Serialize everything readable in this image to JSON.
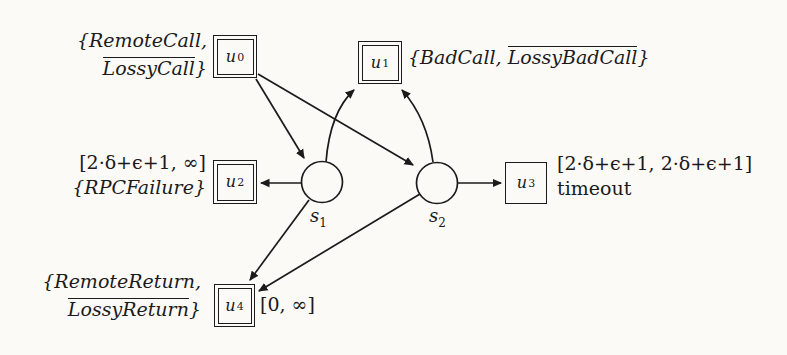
{
  "colors": {
    "ink": "#1b1b1b",
    "paper": "#fbfaf7"
  },
  "nodes": {
    "u0": {
      "base": "u",
      "sup": "0"
    },
    "u1": {
      "base": "u",
      "sup": "1"
    },
    "u2": {
      "base": "u",
      "sup": "2"
    },
    "u3": {
      "base": "u",
      "sup": "3"
    },
    "u4": {
      "base": "u",
      "sup": "4"
    },
    "s1": {
      "base": "s",
      "sub": "1"
    },
    "s2": {
      "base": "s",
      "sub": "2"
    }
  },
  "labels": {
    "u0_events": {
      "line1": "{RemoteCall,",
      "line2_over": "LossyCall",
      "line2_after": "}"
    },
    "u1_events": {
      "before": "{BadCall, ",
      "over": "LossyBadCall",
      "after": "}"
    },
    "u2_interval": "[2·δ+ϵ+1, ∞]",
    "u2_events": "{RPCFailure}",
    "u3_interval": "[2·δ+ϵ+1, 2·δ+ϵ+1]",
    "u3_caption": "timeout",
    "u4_events": {
      "line1": "{RemoteReturn,",
      "line2_over": "LossyReturn",
      "line2_after": "}"
    },
    "u4_interval": "[0, ∞]"
  },
  "edges": [
    {
      "from": "u0",
      "to": "s1"
    },
    {
      "from": "u0",
      "to": "s2"
    },
    {
      "from": "s1",
      "to": "u1"
    },
    {
      "from": "s2",
      "to": "u1"
    },
    {
      "from": "s1",
      "to": "u2"
    },
    {
      "from": "s2",
      "to": "u3"
    },
    {
      "from": "s1",
      "to": "u4"
    },
    {
      "from": "s2",
      "to": "u4"
    }
  ]
}
